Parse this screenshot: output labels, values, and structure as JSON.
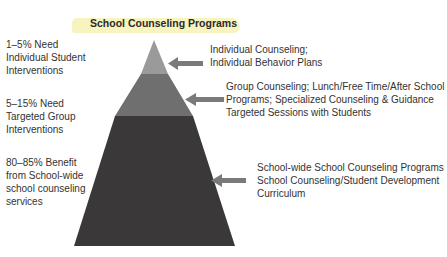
{
  "title": "School Counseling Programs",
  "colors": {
    "title_highlight": "#f6f3b8",
    "tier_top": "#9a9a9a",
    "tier_middle": "#6f6f6f",
    "tier_bottom": "#3a3838",
    "arrow": "#7a7a7a"
  },
  "tiers": [
    {
      "level": "top",
      "left_label": [
        "1–5% Need",
        "Individual Student",
        "Interventions"
      ],
      "right_label": [
        "Individual Counseling;",
        "Individual Behavior Plans"
      ]
    },
    {
      "level": "middle",
      "left_label": [
        "5–15% Need",
        "Targeted Group",
        "Interventions"
      ],
      "right_label": [
        "Group Counseling; Lunch/Free Time/After School",
        "Programs; Specialized Counseling & Guidance",
        "Targeted Sessions with Students"
      ]
    },
    {
      "level": "bottom",
      "left_label": [
        "80–85% Benefit",
        "from School-wide",
        "school counseling",
        "services"
      ],
      "right_label": [
        "School-wide School Counseling Programs",
        "School Counseling/Student Development",
        "Curriculum"
      ]
    }
  ]
}
